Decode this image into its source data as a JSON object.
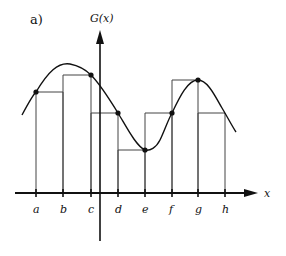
{
  "panel_label": "a)",
  "y_axis_label": "G(x)",
  "x_axis_label": "x",
  "colors": {
    "ink": "#111111",
    "rect": "#444444",
    "background": "#ffffff"
  },
  "ticks": [
    {
      "label": "a",
      "x": 36
    },
    {
      "label": "b",
      "x": 63
    },
    {
      "label": "c",
      "x": 91
    },
    {
      "label": "d",
      "x": 118
    },
    {
      "label": "e",
      "x": 145
    },
    {
      "label": "f",
      "x": 172
    },
    {
      "label": "g",
      "x": 198
    },
    {
      "label": "h",
      "x": 225
    }
  ],
  "points": [
    {
      "at": "a",
      "x": 36,
      "y": 92
    },
    {
      "at": "c",
      "x": 91,
      "y": 75
    },
    {
      "at": "d",
      "x": 118,
      "y": 113
    },
    {
      "at": "e",
      "x": 145,
      "y": 150
    },
    {
      "at": "f",
      "x": 172,
      "y": 113
    },
    {
      "at": "g",
      "x": 198,
      "y": 80
    }
  ],
  "rectangles": [
    {
      "from": "a",
      "to": "b",
      "x1": 36,
      "x2": 63,
      "top": 92
    },
    {
      "from": "b",
      "to": "c",
      "x1": 63,
      "x2": 91,
      "top": 75
    },
    {
      "from": "c",
      "to": "d",
      "x1": 91,
      "x2": 118,
      "top": 113
    },
    {
      "from": "d",
      "to": "e",
      "x1": 118,
      "x2": 145,
      "top": 150
    },
    {
      "from": "e",
      "to": "f",
      "x1": 145,
      "x2": 172,
      "top": 113
    },
    {
      "from": "f",
      "to": "g",
      "x1": 172,
      "x2": 198,
      "top": 80
    },
    {
      "from": "g",
      "to": "h",
      "x1": 198,
      "x2": 225,
      "top": 113
    }
  ]
}
